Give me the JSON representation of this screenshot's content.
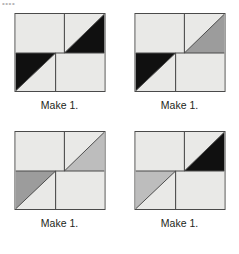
{
  "page": {
    "background_color": "#ffffff",
    "top_edge_artifact": "••••",
    "block_count": 4,
    "layout": "2x2"
  },
  "palette": {
    "background": "#e9e9e7",
    "light": "#e9e9e7",
    "black": "#101010",
    "medium_gray": "#9c9c9c",
    "light_gray": "#bdbdbd",
    "outline": "#4a4a4a",
    "seam_line": "#4a4a4a",
    "text": "#231f20"
  },
  "blocks": [
    {
      "id": "block-1",
      "caption": "Make 1.",
      "top_left_patch": "light rectangle",
      "top_right_patch": "half-square triangle, black lower-right",
      "bottom_left_patch": "half-square triangle, black upper-left",
      "bottom_right_patch": "light rectangle",
      "top_right_triangle_color": "#101010",
      "bottom_left_triangle_color": "#101010"
    },
    {
      "id": "block-2",
      "caption": "Make 1.",
      "top_left_patch": "light rectangle",
      "top_right_patch": "half-square triangle, medium gray lower-right",
      "bottom_left_patch": "half-square triangle, black upper-left",
      "bottom_right_patch": "light rectangle",
      "top_right_triangle_color": "#9c9c9c",
      "bottom_left_triangle_color": "#101010"
    },
    {
      "id": "block-3",
      "caption": "Make 1.",
      "top_left_patch": "light rectangle",
      "top_right_patch": "half-square triangle, light gray lower-right",
      "bottom_left_patch": "half-square triangle, medium gray upper-left",
      "bottom_right_patch": "light rectangle",
      "top_right_triangle_color": "#bdbdbd",
      "bottom_left_triangle_color": "#9c9c9c"
    },
    {
      "id": "block-4",
      "caption": "Make 1.",
      "top_left_patch": "light rectangle",
      "top_right_patch": "half-square triangle, black lower-right",
      "bottom_left_patch": "half-square triangle, light gray upper-left",
      "bottom_right_patch": "light rectangle",
      "top_right_triangle_color": "#101010",
      "bottom_left_triangle_color": "#bdbdbd"
    }
  ]
}
